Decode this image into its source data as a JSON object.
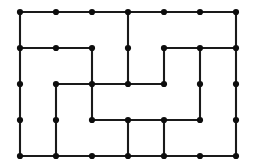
{
  "figure": {
    "name": "grid-graph-puzzle",
    "type": "lattice-graph-drawing",
    "background_color": "#ffffff",
    "edge_color": "#1a1a1a",
    "vertex_color": "#0d0d0d",
    "edge_width": 2.1,
    "vertex_radius": 3.1,
    "canvas": {
      "width": 257,
      "height": 168
    },
    "grid": {
      "columns": 7,
      "rows": 5,
      "x_positions": [
        20,
        56,
        92,
        128,
        164,
        200,
        236
      ],
      "y_positions": [
        12,
        48,
        84,
        120,
        156
      ],
      "spacing_x": 36,
      "spacing_y": 36
    },
    "vertices": [
      {
        "id": "c0r0",
        "col": 0,
        "row": 0,
        "x": 20,
        "y": 12
      },
      {
        "id": "c1r0",
        "col": 1,
        "row": 0,
        "x": 56,
        "y": 12
      },
      {
        "id": "c2r0",
        "col": 2,
        "row": 0,
        "x": 92,
        "y": 12
      },
      {
        "id": "c3r0",
        "col": 3,
        "row": 0,
        "x": 128,
        "y": 12
      },
      {
        "id": "c4r0",
        "col": 4,
        "row": 0,
        "x": 164,
        "y": 12
      },
      {
        "id": "c5r0",
        "col": 5,
        "row": 0,
        "x": 200,
        "y": 12
      },
      {
        "id": "c6r0",
        "col": 6,
        "row": 0,
        "x": 236,
        "y": 12
      },
      {
        "id": "c0r1",
        "col": 0,
        "row": 1,
        "x": 20,
        "y": 48
      },
      {
        "id": "c1r1",
        "col": 1,
        "row": 1,
        "x": 56,
        "y": 48
      },
      {
        "id": "c2r1",
        "col": 2,
        "row": 1,
        "x": 92,
        "y": 48
      },
      {
        "id": "c3r1",
        "col": 3,
        "row": 1,
        "x": 128,
        "y": 48
      },
      {
        "id": "c4r1",
        "col": 4,
        "row": 1,
        "x": 164,
        "y": 48
      },
      {
        "id": "c5r1",
        "col": 5,
        "row": 1,
        "x": 200,
        "y": 48
      },
      {
        "id": "c6r1",
        "col": 6,
        "row": 1,
        "x": 236,
        "y": 48
      },
      {
        "id": "c0r2",
        "col": 0,
        "row": 2,
        "x": 20,
        "y": 84
      },
      {
        "id": "c1r2",
        "col": 1,
        "row": 2,
        "x": 56,
        "y": 84
      },
      {
        "id": "c2r2",
        "col": 2,
        "row": 2,
        "x": 92,
        "y": 84
      },
      {
        "id": "c3r2",
        "col": 3,
        "row": 2,
        "x": 128,
        "y": 84
      },
      {
        "id": "c4r2",
        "col": 4,
        "row": 2,
        "x": 164,
        "y": 84
      },
      {
        "id": "c5r2",
        "col": 5,
        "row": 2,
        "x": 200,
        "y": 84
      },
      {
        "id": "c6r2",
        "col": 6,
        "row": 2,
        "x": 236,
        "y": 84
      },
      {
        "id": "c0r3",
        "col": 0,
        "row": 3,
        "x": 20,
        "y": 120
      },
      {
        "id": "c1r3",
        "col": 1,
        "row": 3,
        "x": 56,
        "y": 120
      },
      {
        "id": "c2r3",
        "col": 2,
        "row": 3,
        "x": 92,
        "y": 120
      },
      {
        "id": "c3r3",
        "col": 3,
        "row": 3,
        "x": 128,
        "y": 120
      },
      {
        "id": "c4r3",
        "col": 4,
        "row": 3,
        "x": 164,
        "y": 120
      },
      {
        "id": "c5r3",
        "col": 5,
        "row": 3,
        "x": 200,
        "y": 120
      },
      {
        "id": "c6r3",
        "col": 6,
        "row": 3,
        "x": 236,
        "y": 120
      },
      {
        "id": "c0r4",
        "col": 0,
        "row": 4,
        "x": 20,
        "y": 156
      },
      {
        "id": "c1r4",
        "col": 1,
        "row": 4,
        "x": 56,
        "y": 156
      },
      {
        "id": "c2r4",
        "col": 2,
        "row": 4,
        "x": 92,
        "y": 156
      },
      {
        "id": "c3r4",
        "col": 3,
        "row": 4,
        "x": 128,
        "y": 156
      },
      {
        "id": "c4r4",
        "col": 4,
        "row": 4,
        "x": 164,
        "y": 156
      },
      {
        "id": "c5r4",
        "col": 5,
        "row": 4,
        "x": 200,
        "y": 156
      },
      {
        "id": "c6r4",
        "col": 6,
        "row": 4,
        "x": 236,
        "y": 156
      }
    ],
    "edges": [
      {
        "id": "h-r0-c0c1",
        "orientation": "horizontal",
        "x1": 20,
        "y1": 12,
        "x2": 56,
        "y2": 12
      },
      {
        "id": "h-r0-c1c2",
        "orientation": "horizontal",
        "x1": 56,
        "y1": 12,
        "x2": 92,
        "y2": 12
      },
      {
        "id": "h-r0-c2c3",
        "orientation": "horizontal",
        "x1": 92,
        "y1": 12,
        "x2": 128,
        "y2": 12
      },
      {
        "id": "h-r0-c3c4",
        "orientation": "horizontal",
        "x1": 128,
        "y1": 12,
        "x2": 164,
        "y2": 12
      },
      {
        "id": "h-r0-c4c5",
        "orientation": "horizontal",
        "x1": 164,
        "y1": 12,
        "x2": 200,
        "y2": 12
      },
      {
        "id": "h-r0-c5c6",
        "orientation": "horizontal",
        "x1": 200,
        "y1": 12,
        "x2": 236,
        "y2": 12
      },
      {
        "id": "h-r1-c0c1",
        "orientation": "horizontal",
        "x1": 20,
        "y1": 48,
        "x2": 56,
        "y2": 48
      },
      {
        "id": "h-r1-c1c2",
        "orientation": "horizontal",
        "x1": 56,
        "y1": 48,
        "x2": 92,
        "y2": 48
      },
      {
        "id": "h-r1-c4c5",
        "orientation": "horizontal",
        "x1": 164,
        "y1": 48,
        "x2": 200,
        "y2": 48
      },
      {
        "id": "h-r1-c5c6",
        "orientation": "horizontal",
        "x1": 200,
        "y1": 48,
        "x2": 236,
        "y2": 48
      },
      {
        "id": "h-r2-c1c2",
        "orientation": "horizontal",
        "x1": 56,
        "y1": 84,
        "x2": 92,
        "y2": 84
      },
      {
        "id": "h-r2-c2c3",
        "orientation": "horizontal",
        "x1": 92,
        "y1": 84,
        "x2": 128,
        "y2": 84
      },
      {
        "id": "h-r2-c3c4",
        "orientation": "horizontal",
        "x1": 128,
        "y1": 84,
        "x2": 164,
        "y2": 84
      },
      {
        "id": "h-r3-c2c3",
        "orientation": "horizontal",
        "x1": 92,
        "y1": 120,
        "x2": 128,
        "y2": 120
      },
      {
        "id": "h-r3-c3c4",
        "orientation": "horizontal",
        "x1": 128,
        "y1": 120,
        "x2": 164,
        "y2": 120
      },
      {
        "id": "h-r3-c4c5",
        "orientation": "horizontal",
        "x1": 164,
        "y1": 120,
        "x2": 200,
        "y2": 120
      },
      {
        "id": "h-r4-c0c1",
        "orientation": "horizontal",
        "x1": 20,
        "y1": 156,
        "x2": 56,
        "y2": 156
      },
      {
        "id": "h-r4-c1c2",
        "orientation": "horizontal",
        "x1": 56,
        "y1": 156,
        "x2": 92,
        "y2": 156
      },
      {
        "id": "h-r4-c2c3",
        "orientation": "horizontal",
        "x1": 92,
        "y1": 156,
        "x2": 128,
        "y2": 156
      },
      {
        "id": "h-r4-c3c4",
        "orientation": "horizontal",
        "x1": 128,
        "y1": 156,
        "x2": 164,
        "y2": 156
      },
      {
        "id": "h-r4-c4c5",
        "orientation": "horizontal",
        "x1": 164,
        "y1": 156,
        "x2": 200,
        "y2": 156
      },
      {
        "id": "h-r4-c5c6",
        "orientation": "horizontal",
        "x1": 200,
        "y1": 156,
        "x2": 236,
        "y2": 156
      },
      {
        "id": "v-c0-r0r1",
        "orientation": "vertical",
        "x1": 20,
        "y1": 12,
        "x2": 20,
        "y2": 48
      },
      {
        "id": "v-c0-r1r2",
        "orientation": "vertical",
        "x1": 20,
        "y1": 48,
        "x2": 20,
        "y2": 84
      },
      {
        "id": "v-c0-r2r3",
        "orientation": "vertical",
        "x1": 20,
        "y1": 84,
        "x2": 20,
        "y2": 120
      },
      {
        "id": "v-c0-r3r4",
        "orientation": "vertical",
        "x1": 20,
        "y1": 120,
        "x2": 20,
        "y2": 156
      },
      {
        "id": "v-c1-r2r3",
        "orientation": "vertical",
        "x1": 56,
        "y1": 84,
        "x2": 56,
        "y2": 120
      },
      {
        "id": "v-c1-r3r4",
        "orientation": "vertical",
        "x1": 56,
        "y1": 120,
        "x2": 56,
        "y2": 156
      },
      {
        "id": "v-c2-r1r2",
        "orientation": "vertical",
        "x1": 92,
        "y1": 48,
        "x2": 92,
        "y2": 84
      },
      {
        "id": "v-c2-r2r3",
        "orientation": "vertical",
        "x1": 92,
        "y1": 84,
        "x2": 92,
        "y2": 120
      },
      {
        "id": "v-c3-r0r1",
        "orientation": "vertical",
        "x1": 128,
        "y1": 12,
        "x2": 128,
        "y2": 48
      },
      {
        "id": "v-c3-r1r2",
        "orientation": "vertical",
        "x1": 128,
        "y1": 48,
        "x2": 128,
        "y2": 84
      },
      {
        "id": "v-c3-r3r4",
        "orientation": "vertical",
        "x1": 128,
        "y1": 120,
        "x2": 128,
        "y2": 156
      },
      {
        "id": "v-c4-r1r2",
        "orientation": "vertical",
        "x1": 164,
        "y1": 48,
        "x2": 164,
        "y2": 84
      },
      {
        "id": "v-c4-r3r4",
        "orientation": "vertical",
        "x1": 164,
        "y1": 120,
        "x2": 164,
        "y2": 156
      },
      {
        "id": "v-c5-r1r2",
        "orientation": "vertical",
        "x1": 200,
        "y1": 48,
        "x2": 200,
        "y2": 84
      },
      {
        "id": "v-c5-r2r3",
        "orientation": "vertical",
        "x1": 200,
        "y1": 84,
        "x2": 200,
        "y2": 120
      },
      {
        "id": "v-c6-r0r1",
        "orientation": "vertical",
        "x1": 236,
        "y1": 12,
        "x2": 236,
        "y2": 48
      },
      {
        "id": "v-c6-r1r2",
        "orientation": "vertical",
        "x1": 236,
        "y1": 48,
        "x2": 236,
        "y2": 84
      },
      {
        "id": "v-c6-r2r3",
        "orientation": "vertical",
        "x1": 236,
        "y1": 84,
        "x2": 236,
        "y2": 120
      },
      {
        "id": "v-c6-r3r4",
        "orientation": "vertical",
        "x1": 236,
        "y1": 120,
        "x2": 236,
        "y2": 156
      }
    ]
  }
}
